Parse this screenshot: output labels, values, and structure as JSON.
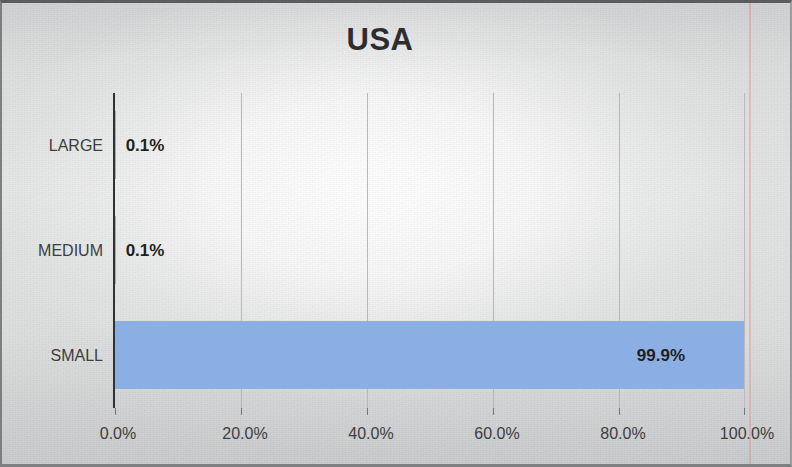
{
  "chart_data": {
    "type": "bar",
    "orientation": "horizontal",
    "title": "USA",
    "xlabel": "",
    "ylabel": "",
    "categories": [
      "LARGE",
      "MEDIUM",
      "SMALL"
    ],
    "values": [
      0.1,
      0.1,
      99.9
    ],
    "data_labels": [
      "0.1%",
      "0.1%",
      "99.9%"
    ],
    "xlim": [
      0,
      100
    ],
    "xtick_values": [
      0,
      20,
      40,
      60,
      80,
      100
    ],
    "xtick_labels": [
      "0.0%",
      "20.0%",
      "40.0%",
      "60.0%",
      "80.0%",
      "100.0%"
    ],
    "grid": "vertical",
    "legend": "none",
    "series": [
      {
        "name": "Share",
        "values": [
          0.1,
          0.1,
          99.9
        ],
        "color": "#8CAFE3"
      }
    ],
    "colors": {
      "bar": "#8CAFE3",
      "axis": "#2F3133",
      "gridline": "#B7B9BB",
      "title_text": "#2D2D30",
      "tick_text": "#3C3E41",
      "data_label_text": "#1F1F22",
      "page_background": "#DCDDDD",
      "frame_border": "#5A5C5E",
      "margin_rule": "#E29696"
    }
  }
}
